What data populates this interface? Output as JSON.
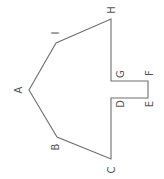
{
  "diagram": {
    "type": "polygon",
    "stroke_color": "#6e6e6e",
    "label_color": "#555555",
    "vertices": [
      {
        "label": "A",
        "x": 29,
        "y": 90,
        "lx": 18,
        "ly": 90
      },
      {
        "label": "B",
        "x": 57,
        "y": 137,
        "lx": 55,
        "ly": 147
      },
      {
        "label": "C",
        "x": 111,
        "y": 159,
        "lx": 111,
        "ly": 170
      },
      {
        "label": "D",
        "x": 111,
        "y": 98,
        "lx": 120,
        "ly": 104
      },
      {
        "label": "E",
        "x": 148,
        "y": 98,
        "lx": 149,
        "ly": 104
      },
      {
        "label": "F",
        "x": 148,
        "y": 81,
        "lx": 149,
        "ly": 73
      },
      {
        "label": "G",
        "x": 111,
        "y": 81,
        "lx": 120,
        "ly": 74
      },
      {
        "label": "H",
        "x": 111,
        "y": 19,
        "lx": 111,
        "ly": 10
      },
      {
        "label": "I",
        "x": 56,
        "y": 43,
        "lx": 55,
        "ly": 33
      }
    ]
  }
}
